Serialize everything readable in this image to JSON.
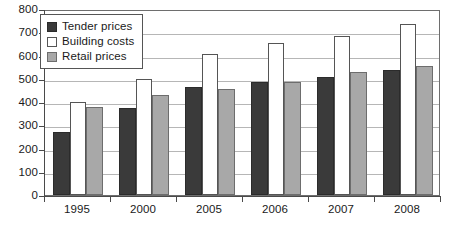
{
  "chart_data": {
    "type": "bar",
    "title": "",
    "subtitle": "",
    "xlabel": "",
    "ylabel": "",
    "categories": [
      "1995",
      "2000",
      "2005",
      "2006",
      "2007",
      "2008"
    ],
    "series": [
      {
        "name": "Tender prices",
        "key": "tender",
        "color": "#3a3a3a",
        "values": [
          270,
          375,
          465,
          488,
          508,
          538
        ]
      },
      {
        "name": "Building costs",
        "key": "building",
        "color": "#ffffff",
        "values": [
          402,
          500,
          605,
          655,
          685,
          735
        ]
      },
      {
        "name": "Retail prices",
        "key": "retail",
        "color": "#a8a8a8",
        "values": [
          378,
          432,
          455,
          485,
          530,
          555
        ]
      }
    ],
    "ylim": [
      0,
      800
    ],
    "ytick_step": 100,
    "yticks": [
      0,
      100,
      200,
      300,
      400,
      500,
      600,
      700,
      800
    ],
    "ytick_labels": [
      "0",
      "100",
      "200",
      "300",
      "400",
      "500",
      "600",
      "700",
      "800"
    ],
    "grid": true,
    "grid_axis": "y",
    "legend_position": "top-left-inside",
    "legend_entries": [
      "Tender prices",
      "Building costs",
      "Retail prices"
    ],
    "annotations": []
  },
  "legend": {
    "items": [
      {
        "label": "Tender prices",
        "swatch": "legend-swatch-tender"
      },
      {
        "label": "Building costs",
        "swatch": "legend-swatch-building"
      },
      {
        "label": "Retail prices",
        "swatch": "legend-swatch-retail"
      }
    ]
  },
  "colors": {
    "tender": "#3a3a3a",
    "building": "#ffffff",
    "retail": "#a8a8a8",
    "grid": "#b6b6b6",
    "axis": "#4a4a4a",
    "frame": "#6e6e6e",
    "text": "#1a1a1a",
    "background": "#ffffff"
  }
}
